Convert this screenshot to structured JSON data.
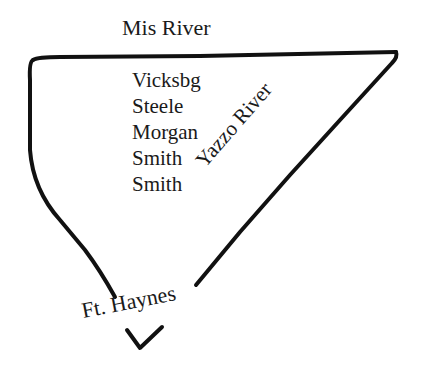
{
  "map": {
    "title": "Mis River",
    "places": [
      "Vicksbg",
      "Steele",
      "Morgan",
      "Smith",
      "Smith"
    ],
    "labels": {
      "river_side": "Yazzo River",
      "fort": "Ft. Haynes"
    },
    "colors": {
      "ink": "#111111",
      "background": "#ffffff"
    }
  }
}
